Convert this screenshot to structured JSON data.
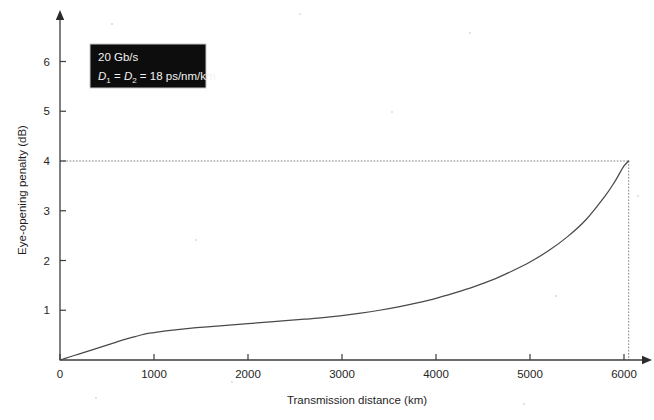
{
  "chart_data": {
    "type": "line",
    "title": "",
    "xlabel": "Transmission distance (km)",
    "ylabel": "Eye-opening penalty (dB)",
    "xlim": [
      0,
      6400
    ],
    "ylim": [
      0,
      6.6
    ],
    "grid": false,
    "legend_position": "top-left",
    "x_ticks": [
      0,
      1000,
      2000,
      3000,
      4000,
      5000,
      6000
    ],
    "x_tick_labels": [
      "0",
      "1000",
      "2000",
      "3000",
      "4000",
      "5000",
      "6000"
    ],
    "y_ticks": [
      1,
      2,
      3,
      4,
      5,
      6
    ],
    "y_tick_labels": [
      "1",
      "2",
      "3",
      "4",
      "5",
      "6"
    ],
    "series": [
      {
        "name": "Eye-opening penalty",
        "x": [
          0,
          100,
          200,
          300,
          400,
          500,
          600,
          700,
          800,
          900,
          1000,
          1200,
          1400,
          1600,
          1800,
          2000,
          2200,
          2400,
          2600,
          2800,
          3000,
          3200,
          3400,
          3600,
          3800,
          4000,
          4200,
          4400,
          4600,
          4800,
          5000,
          5200,
          5400,
          5600,
          5800,
          5900,
          6000,
          6050
        ],
        "y": [
          0.0,
          0.06,
          0.12,
          0.18,
          0.24,
          0.3,
          0.36,
          0.42,
          0.47,
          0.52,
          0.55,
          0.6,
          0.64,
          0.67,
          0.7,
          0.73,
          0.76,
          0.79,
          0.82,
          0.85,
          0.89,
          0.94,
          1.0,
          1.07,
          1.15,
          1.24,
          1.35,
          1.47,
          1.61,
          1.78,
          1.97,
          2.2,
          2.48,
          2.83,
          3.3,
          3.58,
          3.9,
          4.0
        ]
      }
    ],
    "annotations": [
      {
        "name": "penalty-4db-guide",
        "type": "dotted-crosshair",
        "x": 6050,
        "y": 4.0,
        "description": "dotted horizontal line at 4 dB and dotted vertical line at 6050 km marking the 4 dB penalty point"
      }
    ]
  },
  "legend": {
    "line1": "20 Gb/s",
    "d1_symbol": "D",
    "d1_sub": "1",
    "equals_1": "=",
    "d2_symbol": "D",
    "d2_sub": "2",
    "equals_2": "=",
    "value": "18 ps/nm/km",
    "line2_plain": "D1 = D2 = 18 ps/nm/km"
  },
  "colors": {
    "curve": "#4a4a4a",
    "axis": "#3b3b3b",
    "guide": "#7d7d7d",
    "legend_background": "#0d0d0d",
    "legend_border": "#c8c8c8",
    "legend_text": "#f2f2f2",
    "page_background": "#ffffff"
  }
}
